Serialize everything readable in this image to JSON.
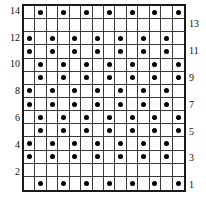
{
  "chart_data": {
    "type": "heatmap",
    "title": "",
    "subtitle": "",
    "xlabel": "",
    "ylabel": "",
    "grid": true,
    "legend_position": "none",
    "columns": 14,
    "rows": 14,
    "x": [
      1,
      2,
      3,
      4,
      5,
      6,
      7,
      8,
      9,
      10,
      11,
      12,
      13,
      14
    ],
    "row_labels_left": [
      "14",
      "",
      "12",
      "",
      "10",
      "",
      "8",
      "",
      "6",
      "",
      "4",
      "",
      "2",
      ""
    ],
    "row_labels_right": [
      "",
      "13",
      "",
      "11",
      "",
      "9",
      "",
      "7",
      "",
      "5",
      "",
      "3",
      "",
      "1"
    ],
    "left_tick_values": [
      14,
      12,
      10,
      8,
      6,
      4,
      2
    ],
    "right_tick_values": [
      13,
      11,
      9,
      7,
      5,
      3,
      1
    ],
    "marker": "filled-dot",
    "marker_color": "#000000",
    "cell_color": "#ffffff",
    "grid_line_color": "#3a3a3a",
    "border_color": "#1a1a1a",
    "series": [
      {
        "name": "row-14",
        "row_number": 14,
        "filled_columns": [
          2,
          4,
          6,
          8,
          10,
          12,
          14
        ],
        "values": [
          0,
          1,
          0,
          1,
          0,
          1,
          0,
          1,
          0,
          1,
          0,
          1,
          0,
          1
        ]
      },
      {
        "name": "row-13",
        "row_number": 13,
        "filled_columns": [],
        "values": [
          0,
          0,
          0,
          0,
          0,
          0,
          0,
          0,
          0,
          0,
          0,
          0,
          0,
          0
        ]
      },
      {
        "name": "row-12",
        "row_number": 12,
        "filled_columns": [
          1,
          3,
          5,
          7,
          9,
          11,
          13
        ],
        "values": [
          1,
          0,
          1,
          0,
          1,
          0,
          1,
          0,
          1,
          0,
          1,
          0,
          1,
          0
        ]
      },
      {
        "name": "row-11",
        "row_number": 11,
        "filled_columns": [
          1,
          3,
          5,
          7,
          9,
          11,
          13
        ],
        "values": [
          1,
          0,
          1,
          0,
          1,
          0,
          1,
          0,
          1,
          0,
          1,
          0,
          1,
          0
        ]
      },
      {
        "name": "row-10",
        "row_number": 10,
        "filled_columns": [
          2,
          4,
          6,
          8,
          10,
          12,
          14
        ],
        "values": [
          0,
          1,
          0,
          1,
          0,
          1,
          0,
          1,
          0,
          1,
          0,
          1,
          0,
          1
        ]
      },
      {
        "name": "row-9",
        "row_number": 9,
        "filled_columns": [
          2,
          4,
          6,
          8,
          10,
          12,
          14
        ],
        "values": [
          0,
          1,
          0,
          1,
          0,
          1,
          0,
          1,
          0,
          1,
          0,
          1,
          0,
          1
        ]
      },
      {
        "name": "row-8",
        "row_number": 8,
        "filled_columns": [
          1,
          3,
          5,
          7,
          9,
          11,
          13
        ],
        "values": [
          1,
          0,
          1,
          0,
          1,
          0,
          1,
          0,
          1,
          0,
          1,
          0,
          1,
          0
        ]
      },
      {
        "name": "row-7",
        "row_number": 7,
        "filled_columns": [
          1,
          3,
          5,
          7,
          9,
          11,
          13
        ],
        "values": [
          1,
          0,
          1,
          0,
          1,
          0,
          1,
          0,
          1,
          0,
          1,
          0,
          1,
          0
        ]
      },
      {
        "name": "row-6",
        "row_number": 6,
        "filled_columns": [
          2,
          4,
          6,
          8,
          10,
          12,
          14
        ],
        "values": [
          0,
          1,
          0,
          1,
          0,
          1,
          0,
          1,
          0,
          1,
          0,
          1,
          0,
          1
        ]
      },
      {
        "name": "row-5",
        "row_number": 5,
        "filled_columns": [
          2,
          4,
          6,
          8,
          10,
          12,
          14
        ],
        "values": [
          0,
          1,
          0,
          1,
          0,
          1,
          0,
          1,
          0,
          1,
          0,
          1,
          0,
          1
        ]
      },
      {
        "name": "row-4",
        "row_number": 4,
        "filled_columns": [
          1,
          3,
          5,
          7,
          9,
          11,
          13
        ],
        "values": [
          1,
          0,
          1,
          0,
          1,
          0,
          1,
          0,
          1,
          0,
          1,
          0,
          1,
          0
        ]
      },
      {
        "name": "row-3",
        "row_number": 3,
        "filled_columns": [
          1,
          3,
          5,
          7,
          9,
          11,
          13
        ],
        "values": [
          1,
          0,
          1,
          0,
          1,
          0,
          1,
          0,
          1,
          0,
          1,
          0,
          1,
          0
        ]
      },
      {
        "name": "row-2",
        "row_number": 2,
        "filled_columns": [],
        "values": [
          0,
          0,
          0,
          0,
          0,
          0,
          0,
          0,
          0,
          0,
          0,
          0,
          0,
          0
        ]
      },
      {
        "name": "row-1",
        "row_number": 1,
        "filled_columns": [
          2,
          4,
          6,
          8,
          10,
          12,
          14
        ],
        "values": [
          0,
          1,
          0,
          1,
          0,
          1,
          0,
          1,
          0,
          1,
          0,
          1,
          0,
          1
        ]
      }
    ]
  }
}
